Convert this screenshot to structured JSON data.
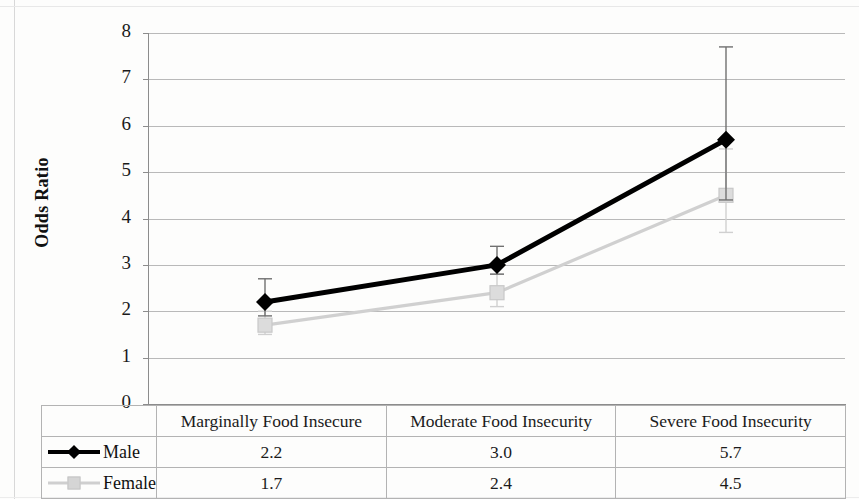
{
  "chart_data": {
    "type": "line",
    "title": "",
    "xlabel": "",
    "ylabel": "Odds Ratio",
    "ylim": [
      0,
      8
    ],
    "yticks": [
      "0",
      "1",
      "2",
      "3",
      "4",
      "5",
      "6",
      "7",
      "8"
    ],
    "grid": true,
    "legend_position": "bottom-table",
    "categories": [
      "Marginally Food Insecure",
      "Moderate Food Insecurity",
      "Severe Food Insecurity"
    ],
    "series": [
      {
        "name": "Male",
        "values": [
          2.2,
          3.0,
          5.7
        ],
        "labels": [
          "2.2",
          "3.0",
          "5.7"
        ],
        "color": "#000000",
        "marker": "diamond",
        "error_low": [
          1.9,
          2.8,
          4.4
        ],
        "error_high": [
          2.7,
          3.4,
          7.7
        ]
      },
      {
        "name": "Female",
        "values": [
          1.7,
          2.4,
          4.5
        ],
        "labels": [
          "1.7",
          "2.4",
          "4.5"
        ],
        "color": "#d0d0d0",
        "marker": "square",
        "error_low": [
          1.5,
          2.1,
          3.7
        ],
        "error_high": [
          2.0,
          2.8,
          5.5
        ]
      }
    ]
  },
  "axis": {
    "y_title": "Odds Ratio",
    "ticks": [
      {
        "value": "8"
      },
      {
        "value": "7"
      },
      {
        "value": "6"
      },
      {
        "value": "5"
      },
      {
        "value": "4"
      },
      {
        "value": "3"
      },
      {
        "value": "2"
      },
      {
        "value": "1"
      },
      {
        "value": "0"
      }
    ]
  },
  "table": {
    "header": {
      "legend_blank": "",
      "columns": [
        "Marginally Food Insecure",
        "Moderate Food Insecurity",
        "Severe Food Insecurity"
      ]
    },
    "rows": [
      {
        "legend": "Male",
        "marker": "diamond-marker",
        "values": [
          "2.2",
          "3.0",
          "5.7"
        ]
      },
      {
        "legend": "Female",
        "marker": "square-marker",
        "values": [
          "1.7",
          "2.4",
          "4.5"
        ]
      }
    ]
  },
  "colors": {
    "male": "#000000",
    "female": "#d0d0d0",
    "grid": "#b9b9b9",
    "axis": "#8c8c8c",
    "table_border": "#b3b3b3"
  }
}
